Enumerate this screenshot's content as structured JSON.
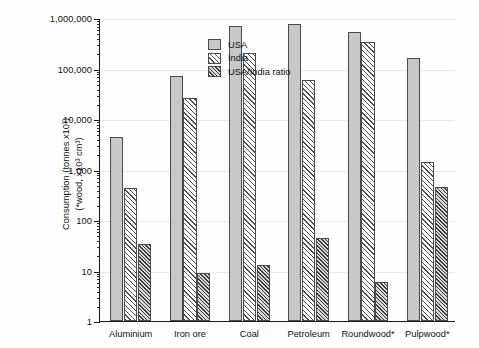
{
  "chart_data": {
    "type": "bar",
    "title": "",
    "subtitle": "",
    "xlabel": "",
    "ylabel_line1": "Consumption (tonnes x10³)",
    "ylabel_line2": "(*wood, x10³ cm³)",
    "yscale": "log",
    "ylim": [
      1,
      1000000
    ],
    "grid": true,
    "legend_position": "top-left",
    "categories": [
      "Aluminium",
      "Iron ore",
      "Coal",
      "Petroleum",
      "Roundwood*",
      "Pulpwood*"
    ],
    "ytick_labels": [
      "1",
      "10",
      "100",
      "1,000",
      "10,000",
      "100,000",
      "1,000,000"
    ],
    "ytick_values": [
      1,
      10,
      100,
      1000,
      10000,
      100000,
      1000000
    ],
    "series": [
      {
        "name": "USA",
        "pattern": "solid-grey-stipple",
        "color": "#c8c8c8",
        "values": [
          4400,
          72000,
          700000,
          750000,
          530000,
          160000
        ]
      },
      {
        "name": "India",
        "pattern": "diagonal-hatch",
        "color": "#ffffff",
        "values": [
          430,
          26000,
          200000,
          60000,
          330000,
          1400
        ]
      },
      {
        "name": "USA/India ratio",
        "pattern": "dense-diagonal-hatch",
        "color": "#b9b9b9",
        "values": [
          33,
          9,
          13,
          45,
          6,
          450
        ]
      }
    ]
  },
  "legend": {
    "items": [
      {
        "label": "USA"
      },
      {
        "label": "India"
      },
      {
        "label": "USA/India ratio"
      }
    ]
  }
}
